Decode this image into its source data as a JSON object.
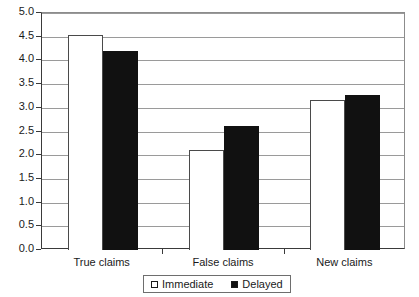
{
  "chart_data": {
    "type": "bar",
    "title": "",
    "subtitle": "",
    "xlabel": "",
    "ylabel": "",
    "categories": [
      "True claims",
      "False claims",
      "New claims"
    ],
    "series": [
      {
        "name": "Immediate",
        "values": [
          4.53,
          2.1,
          3.17
        ],
        "color": "#ffffff"
      },
      {
        "name": "Delayed",
        "values": [
          4.2,
          2.62,
          3.27
        ],
        "color": "#111111"
      }
    ],
    "ylim": [
      0.0,
      5.0
    ],
    "ytick_step": 0.5,
    "ytick_labels": [
      "0.0",
      "0.5",
      "1.0",
      "1.5",
      "2.0",
      "2.5",
      "3.0",
      "3.5",
      "4.0",
      "4.5",
      "5.0"
    ],
    "grid": true,
    "grid_axis": "y",
    "legend_position": "bottom",
    "legend_border": true,
    "annotations": []
  },
  "legend": {
    "entries": [
      {
        "label": "Immediate",
        "marker": "open-square"
      },
      {
        "label": "Delayed",
        "marker": "filled-square"
      }
    ]
  }
}
